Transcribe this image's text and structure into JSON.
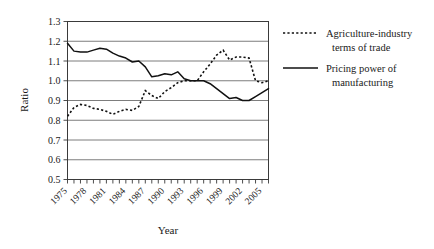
{
  "chart_data": {
    "type": "line",
    "title": "",
    "xlabel": "Year",
    "ylabel": "Ratio",
    "ylim": [
      0.5,
      1.3
    ],
    "ytick_labels": [
      "1.3",
      "1.2",
      "1.1",
      "1.0",
      "0.9",
      "0.8",
      "0.7",
      "0.6",
      "0.5"
    ],
    "ytick_values": [
      1.3,
      1.2,
      1.1,
      1.0,
      0.9,
      0.8,
      0.7,
      0.6,
      0.5
    ],
    "grid": "horizontal",
    "legend_position": "right",
    "xlim": [
      1975,
      2006
    ],
    "x": [
      1975,
      1976,
      1977,
      1978,
      1979,
      1980,
      1981,
      1982,
      1983,
      1984,
      1985,
      1986,
      1987,
      1988,
      1989,
      1990,
      1991,
      1992,
      1993,
      1994,
      1995,
      1996,
      1997,
      1998,
      1999,
      2000,
      2001,
      2002,
      2003,
      2004,
      2005,
      2006
    ],
    "xtick_labels": [
      "1975",
      "1978",
      "1981",
      "1984",
      "1987",
      "1990",
      "1993",
      "1996",
      "1999",
      "2002",
      "2005"
    ],
    "xtick_label_values": [
      1975,
      1978,
      1981,
      1984,
      1987,
      1990,
      1993,
      1996,
      1999,
      2002,
      2005
    ],
    "series": [
      {
        "name": "Agriculture-industry terms of trade",
        "style": "dashed",
        "values": [
          0.82,
          0.865,
          0.88,
          0.875,
          0.86,
          0.855,
          0.845,
          0.83,
          0.845,
          0.855,
          0.85,
          0.87,
          0.95,
          0.925,
          0.91,
          0.945,
          0.965,
          0.99,
          1.0,
          1.0,
          1.0,
          1.045,
          1.085,
          1.13,
          1.155,
          1.105,
          1.12,
          1.12,
          1.115,
          1.0,
          0.99,
          1.0
        ]
      },
      {
        "name": "Pricing power of manufacturing",
        "style": "solid",
        "values": [
          1.19,
          1.15,
          1.145,
          1.145,
          1.155,
          1.165,
          1.16,
          1.14,
          1.125,
          1.115,
          1.095,
          1.1,
          1.07,
          1.02,
          1.025,
          1.035,
          1.03,
          1.045,
          1.01,
          1.0,
          1.0,
          1.0,
          0.985,
          0.96,
          0.935,
          0.91,
          0.915,
          0.9,
          0.9,
          0.92,
          0.94,
          0.96
        ]
      }
    ]
  },
  "legend": {
    "items": [
      {
        "label_line1": "Agriculture-industry",
        "label_line2": "terms of trade",
        "sample": "dashed-line-sample"
      },
      {
        "label_line1": "Pricing power of",
        "label_line2": "manufacturing",
        "sample": "solid-line-sample"
      }
    ]
  }
}
